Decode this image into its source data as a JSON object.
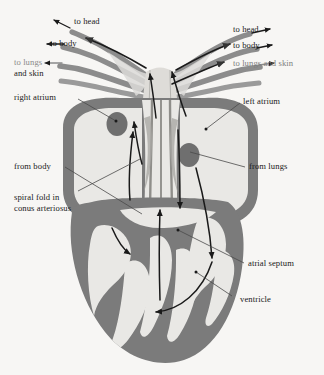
{
  "figure": {
    "background_color": "#f7f6f4",
    "colors": {
      "muscle_dark_gray": "#7b7b7b",
      "chamber_light_gray": "#e8e7e4",
      "vessel_gray": "#8a8a8a",
      "outline_black": "#1a1a1a",
      "leader_line": "#555555",
      "label_text": "#1a1a1a",
      "faded_text": "#8a8a8a"
    }
  },
  "labels": {
    "to_head_left": "to head",
    "to_body_left": "to body",
    "to_lungs_left_line1": "to lungs",
    "to_lungs_left_line2": "and skin",
    "to_head_right": "to head",
    "to_body_right": "to body",
    "to_lungs_right": "to lungs and skin",
    "right_atrium": "right atrium",
    "left_atrium": "left atrium",
    "from_body": "from body",
    "from_lungs": "from lungs",
    "spiral_fold_line1": "spiral fold in",
    "spiral_fold_line2": "conus arteriosus",
    "atrial_septum": "atrial septum",
    "ventricle": "ventricle"
  },
  "structures": [
    {
      "name": "right-atrium",
      "label": "right atrium",
      "side": "left"
    },
    {
      "name": "left-atrium",
      "label": "left atrium",
      "side": "right"
    },
    {
      "name": "ventricle",
      "label": "ventricle",
      "side": "bottom"
    },
    {
      "name": "atrial-septum",
      "label": "atrial septum",
      "side": "center"
    },
    {
      "name": "conus-arteriosus",
      "label": "spiral fold in conus arteriosus",
      "side": "left"
    }
  ],
  "vessels": [
    {
      "name": "carotid-arch-left",
      "label": "to head",
      "direction": "outflow"
    },
    {
      "name": "systemic-arch-left",
      "label": "to body",
      "direction": "outflow"
    },
    {
      "name": "pulmocutaneous-arch-left",
      "label": "to lungs and skin",
      "direction": "outflow"
    },
    {
      "name": "carotid-arch-right",
      "label": "to head",
      "direction": "outflow"
    },
    {
      "name": "systemic-arch-right",
      "label": "to body",
      "direction": "outflow"
    },
    {
      "name": "pulmocutaneous-arch-right",
      "label": "to lungs and skin",
      "direction": "outflow"
    },
    {
      "name": "vena-cava",
      "label": "from body",
      "direction": "inflow"
    },
    {
      "name": "pulmonary-vein",
      "label": "from lungs",
      "direction": "inflow"
    }
  ]
}
